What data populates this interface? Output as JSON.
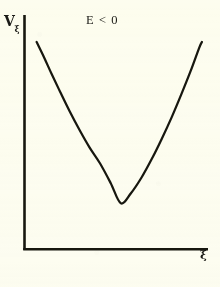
{
  "figure": {
    "background_color": "#fdfdf3",
    "ink_color": "#17170f",
    "title": "E < 0",
    "y_axis_label_base": "V",
    "y_axis_label_subscript": "ξ",
    "x_axis_label": "ξ"
  },
  "chart_data": {
    "type": "line",
    "title": "E < 0",
    "xlabel": "ξ",
    "ylabel": "Vξ",
    "grid": false,
    "legend": null,
    "axis_style": "open-L (left spine and bottom spine only, no ticks, no tick labels)",
    "xlim": [
      0,
      1
    ],
    "ylim": [
      0,
      1
    ],
    "series": [
      {
        "name": "effective potential V_xi for E < 0",
        "shape": "upward-opening parabola / potential well",
        "minimum": {
          "x": 0.525,
          "y": 0.196
        },
        "x": [
          0.066,
          0.105,
          0.148,
          0.196,
          0.246,
          0.3,
          0.355,
          0.412,
          0.47,
          0.525,
          0.58,
          0.637,
          0.694,
          0.749,
          0.803,
          0.855,
          0.905,
          0.952,
          0.967
        ],
        "y": [
          0.885,
          0.822,
          0.748,
          0.669,
          0.589,
          0.509,
          0.434,
          0.366,
          0.282,
          0.196,
          0.239,
          0.305,
          0.386,
          0.473,
          0.565,
          0.662,
          0.76,
          0.86,
          0.885
        ]
      }
    ]
  }
}
